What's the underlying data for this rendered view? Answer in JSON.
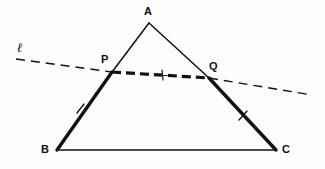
{
  "figure": {
    "kind": "geometry-diagram",
    "background_color": "#fdfdfd",
    "ink_color": "#111111",
    "width": 325,
    "height": 169
  },
  "labels": {
    "apex": "A",
    "left_base": "B",
    "right_base": "C",
    "point_on_ab": "P",
    "point_on_ac": "Q",
    "line": "ℓ"
  },
  "points": {
    "A": {
      "x": 149,
      "y": 23
    },
    "B": {
      "x": 57,
      "y": 150
    },
    "C": {
      "x": 276,
      "y": 150
    },
    "P": {
      "x": 112,
      "y": 72
    },
    "Q": {
      "x": 209,
      "y": 78
    },
    "L_start": {
      "x": 16,
      "y": 59
    },
    "L_end": {
      "x": 312,
      "y": 95
    }
  },
  "label_positions": {
    "A": {
      "x": 144,
      "y": 6
    },
    "B": {
      "x": 41,
      "y": 144
    },
    "C": {
      "x": 282,
      "y": 144
    },
    "P": {
      "x": 101,
      "y": 54
    },
    "Q": {
      "x": 209,
      "y": 61
    },
    "l": {
      "x": 17,
      "y": 41
    }
  },
  "segments": [
    {
      "name": "AP",
      "from": "A",
      "to": "P",
      "weight": "thin",
      "style": "solid"
    },
    {
      "name": "AQ",
      "from": "A",
      "to": "Q",
      "weight": "thin",
      "style": "solid"
    },
    {
      "name": "PB",
      "from": "P",
      "to": "B",
      "weight": "thick",
      "style": "solid"
    },
    {
      "name": "QC",
      "from": "Q",
      "to": "C",
      "weight": "thick",
      "style": "solid"
    },
    {
      "name": "BC",
      "from": "B",
      "to": "C",
      "weight": "thin",
      "style": "solid"
    },
    {
      "name": "PQ",
      "from": "P",
      "to": "Q",
      "weight": "thick",
      "style": "dashed"
    },
    {
      "name": "l-left",
      "from": "L_start",
      "to": "P",
      "weight": "thin",
      "style": "dashed"
    },
    {
      "name": "l-right",
      "from": "Q",
      "to": "L_end",
      "weight": "thin",
      "style": "dashed"
    }
  ],
  "tick_marks": [
    {
      "name": "tick-pb",
      "on": "PB",
      "x": 80,
      "y": 109,
      "glyph": "single-slash"
    },
    {
      "name": "tick-qc",
      "on": "QC",
      "x": 243,
      "y": 116,
      "glyph": "single-slash"
    },
    {
      "name": "tick-pq",
      "on": "PQ",
      "x": 162,
      "y": 75,
      "glyph": "plus-cross"
    }
  ],
  "chart_data": {
    "type": "diagram",
    "elements": {
      "triangle_vertices": [
        "A",
        "B",
        "C"
      ],
      "transversal_points": [
        "P",
        "Q"
      ],
      "transversal_name": "ℓ",
      "congruent_marks": {
        "single_slash": [
          "PB",
          "QC"
        ],
        "plus_cross": [
          "PQ"
        ]
      }
    }
  }
}
